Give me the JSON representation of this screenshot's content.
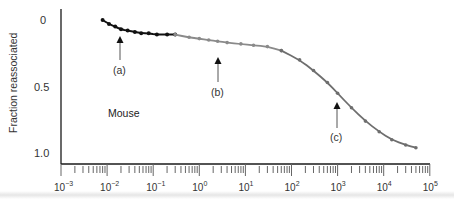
{
  "chart_data": {
    "type": "line",
    "title": "",
    "xlabel": "",
    "ylabel": "Fraction reassociated",
    "x_scale": "log",
    "xlim": [
      0.001,
      100000
    ],
    "ylim": [
      0,
      1.0
    ],
    "y_inverted": true,
    "x_ticks": [
      "10-3",
      "10-2",
      "10-1",
      "100",
      "101",
      "102",
      "103",
      "104",
      "105"
    ],
    "x_tick_exponents": [
      -3,
      -2,
      -1,
      0,
      1,
      2,
      3,
      4,
      5
    ],
    "y_ticks": [
      "0",
      "0.5",
      "1.0"
    ],
    "y_tick_values": [
      0,
      0.5,
      1.0
    ],
    "grid": false,
    "legend": null,
    "annotations": [
      {
        "label": "(a)",
        "x": 0.018,
        "note": "arrow pointing up to fast component"
      },
      {
        "label": "(b)",
        "x": 2.5,
        "note": "arrow pointing up to intermediate component"
      },
      {
        "label": "(c)",
        "x": 1000,
        "note": "arrow pointing up to slow component"
      },
      {
        "label": "Mouse",
        "x": 0.02,
        "y": 0.55
      }
    ],
    "series": [
      {
        "name": "fast component",
        "color": "#111111",
        "points": [
          [
            0.008,
            0.0
          ],
          [
            0.011,
            0.03
          ],
          [
            0.015,
            0.05
          ],
          [
            0.02,
            0.07
          ],
          [
            0.028,
            0.08
          ],
          [
            0.04,
            0.09
          ],
          [
            0.055,
            0.1
          ],
          [
            0.08,
            0.1
          ],
          [
            0.12,
            0.11
          ],
          [
            0.2,
            0.11
          ],
          [
            0.3,
            0.11
          ]
        ]
      },
      {
        "name": "intermediate component",
        "color": "#8a8a8a",
        "points": [
          [
            0.3,
            0.11
          ],
          [
            0.6,
            0.13
          ],
          [
            1.0,
            0.14
          ],
          [
            1.6,
            0.15
          ],
          [
            2.5,
            0.16
          ],
          [
            4,
            0.17
          ],
          [
            8,
            0.18
          ],
          [
            15,
            0.19
          ],
          [
            30,
            0.2
          ],
          [
            60,
            0.23
          ]
        ]
      },
      {
        "name": "slow component",
        "color": "#6e6e6e",
        "points": [
          [
            60,
            0.23
          ],
          [
            150,
            0.3
          ],
          [
            300,
            0.38
          ],
          [
            600,
            0.47
          ],
          [
            1000,
            0.55
          ],
          [
            2000,
            0.66
          ],
          [
            4000,
            0.76
          ],
          [
            8000,
            0.84
          ],
          [
            15000,
            0.9
          ],
          [
            30000,
            0.94
          ],
          [
            50000,
            0.96
          ]
        ]
      }
    ]
  },
  "labels": {
    "ylabel": "Fraction reassociated",
    "mouse": "Mouse",
    "a": "(a)",
    "b": "(b)",
    "c": "(c)",
    "y0": "0",
    "y05": "0.5",
    "y10": "1.0"
  }
}
